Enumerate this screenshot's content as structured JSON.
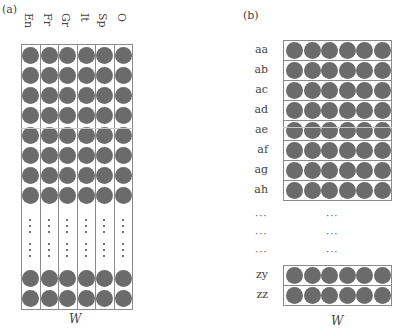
{
  "panel_a": {
    "label": "(a)",
    "columns": [
      "En",
      "Fr",
      "Gr",
      "It",
      "Sp",
      "O"
    ],
    "top_rows": 8,
    "bottom_rows": 2,
    "axis_label": "W"
  },
  "panel_b": {
    "label": "(b)",
    "top_rows": [
      "aa",
      "ab",
      "ac",
      "ad",
      "ae",
      "af",
      "ag",
      "ah"
    ],
    "ellipsis_rows": [
      "···",
      "···",
      "···"
    ],
    "bottom_rows": [
      "zy",
      "zz"
    ],
    "circles_per_row": 6,
    "axis_label": "W"
  },
  "colors": {
    "circle": "#6b6b6b",
    "box_border": "#8a8a8a",
    "text": "#444444"
  }
}
